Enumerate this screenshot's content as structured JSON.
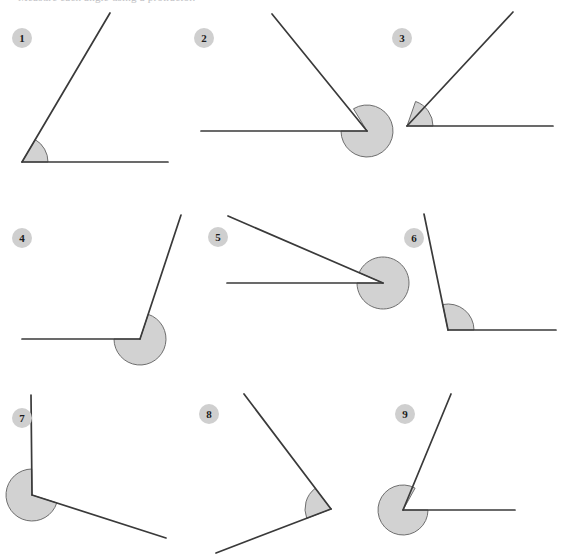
{
  "document": {
    "title": "Measure each angle worksheet",
    "header_partial_text": "Measure each angle using a protractor.",
    "background_color": "#ffffff",
    "line_color": "#3a3a3a",
    "arc_fill_color": "#d2d2d2",
    "arc_stroke_color": "#6e6e6e",
    "badge_fill_color": "#cfcfcf",
    "badge_text_color": "#1c1c1c"
  },
  "canvas": {
    "width": 566,
    "height": 557
  },
  "chart_data": {
    "type": "diagram",
    "title": "Measure each angle using a protractor.",
    "columns": 3,
    "rows": 3,
    "items": [
      {
        "label": "1",
        "badge": {
          "cx": 12,
          "cy": 28
        },
        "vertex": {
          "x": 22,
          "y": 162
        },
        "ray_a": {
          "x": 168,
          "y": 162,
          "angle_deg": 0
        },
        "ray_b": {
          "x": 110,
          "y": 13,
          "angle_deg": 59.5
        },
        "angle_deg": 60,
        "arc_radius": 26,
        "reflex": false
      },
      {
        "label": "2",
        "badge": {
          "cx": 194,
          "cy": 28
        },
        "vertex": {
          "x": 367,
          "y": 131
        },
        "ray_a": {
          "x": 201,
          "y": 131,
          "angle_deg": 180
        },
        "ray_b": {
          "x": 272,
          "y": 14,
          "angle_deg": 121.3
        },
        "angle_deg": 59,
        "arc_radius": 26,
        "reflex": false
      },
      {
        "label": "3",
        "badge": {
          "cx": 392,
          "cy": 28
        },
        "vertex": {
          "x": 407,
          "y": 126
        },
        "ray_a": {
          "x": 553,
          "y": 126,
          "angle_deg": 0
        },
        "ray_b": {
          "x": 513,
          "y": 12,
          "angle_deg": 70.7
        },
        "angle_deg": 71,
        "arc_radius": 26,
        "reflex": false
      },
      {
        "label": "4",
        "badge": {
          "cx": 12,
          "cy": 228
        },
        "vertex": {
          "x": 140,
          "y": 339
        },
        "ray_a": {
          "x": 22,
          "y": 339,
          "angle_deg": 180
        },
        "ray_b": {
          "x": 181,
          "y": 215,
          "angle_deg": 71.6
        },
        "angle_deg": 108,
        "arc_radius": 26,
        "reflex": false
      },
      {
        "label": "5",
        "badge": {
          "cx": 208,
          "cy": 227
        },
        "vertex": {
          "x": 383,
          "y": 283
        },
        "ray_a": {
          "x": 227,
          "y": 283,
          "angle_deg": 180
        },
        "ray_b": {
          "x": 228,
          "y": 216,
          "angle_deg": 156.6
        },
        "angle_deg": 23,
        "arc_radius": 26,
        "reflex": false
      },
      {
        "label": "6",
        "badge": {
          "cx": 404,
          "cy": 228
        },
        "vertex": {
          "x": 448,
          "y": 330
        },
        "ray_a": {
          "x": 556,
          "y": 330,
          "angle_deg": 0
        },
        "ray_b": {
          "x": 424,
          "y": 214,
          "angle_deg": 101.7
        },
        "angle_deg": 102,
        "arc_radius": 26,
        "reflex": false
      },
      {
        "label": "7",
        "badge": {
          "cx": 12,
          "cy": 408
        },
        "vertex": {
          "x": 32,
          "y": 495
        },
        "ray_a": {
          "x": 31,
          "y": 395,
          "angle_deg": 90.6
        },
        "ray_b": {
          "x": 166,
          "y": 538,
          "angle_deg": -17.7
        },
        "angle_deg": 108,
        "arc_radius": 26,
        "reflex": false
      },
      {
        "label": "8",
        "badge": {
          "cx": 199,
          "cy": 404
        },
        "vertex": {
          "x": 331,
          "y": 509
        },
        "ray_a": {
          "x": 244,
          "y": 394,
          "angle_deg": 127.2
        },
        "ray_b": {
          "x": 216,
          "y": 553,
          "angle_deg": -158.9
        },
        "angle_deg": 74,
        "arc_radius": 26,
        "reflex": false
      },
      {
        "label": "9",
        "badge": {
          "cx": 395,
          "cy": 404
        },
        "vertex": {
          "x": 403,
          "y": 510
        },
        "ray_a": {
          "x": 515,
          "y": 510,
          "angle_deg": 0
        },
        "ray_b": {
          "x": 451,
          "y": 394,
          "angle_deg": 61.1
        },
        "angle_deg": 299,
        "arc_radius": 25,
        "reflex": true
      }
    ]
  }
}
